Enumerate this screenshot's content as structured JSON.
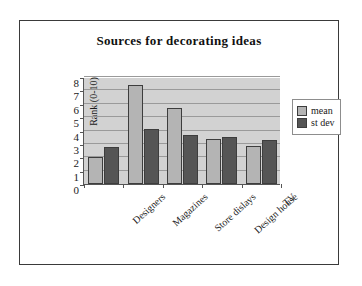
{
  "chart_data": {
    "type": "bar",
    "title": "Sources for decorating ideas",
    "xlabel": "",
    "ylabel": "Rank (0-10)",
    "ylim": [
      0,
      8
    ],
    "yticks": [
      0,
      1,
      2,
      3,
      4,
      5,
      6,
      7,
      8
    ],
    "ytick_labels": [
      "0",
      "1",
      "2",
      "3",
      "4",
      "5",
      "6",
      "7",
      "8"
    ],
    "grid": "horizontal",
    "legend_position": "right",
    "categories": [
      "Designers",
      "Magazines",
      "Store dislays",
      "Design house",
      "TV"
    ],
    "series": [
      {
        "name": "mean",
        "color": "#b4b4b4",
        "values": [
          2.0,
          7.4,
          5.7,
          3.4,
          2.85
        ]
      },
      {
        "name": "st dev",
        "color": "#555555",
        "values": [
          2.8,
          4.1,
          3.7,
          3.55,
          3.3
        ]
      }
    ],
    "plot_background": "#d2d2d2",
    "axis_color": "#555555"
  },
  "legend": {
    "items": [
      {
        "label": "mean"
      },
      {
        "label": "st dev"
      }
    ]
  }
}
